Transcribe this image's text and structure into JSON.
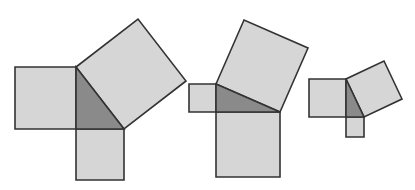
{
  "diagram": {
    "title": "",
    "colors": {
      "square_fill": "#d6d6d6",
      "triangle_fill": "#8a8a8a",
      "stroke": "#333333",
      "background": "#ffffff"
    },
    "figures": [
      {
        "id": "figure-1",
        "triangle": [
          [
            76,
            67
          ],
          [
            76,
            129
          ],
          [
            124,
            129
          ]
        ],
        "squares": [
          [
            [
              15,
              67
            ],
            [
              76,
              67
            ],
            [
              76,
              129
            ],
            [
              15,
              129
            ]
          ],
          [
            [
              76,
              129
            ],
            [
              124,
              129
            ],
            [
              124,
              180
            ],
            [
              76,
              180
            ]
          ],
          [
            [
              76,
              67
            ],
            [
              124,
              129
            ],
            [
              186,
              81
            ],
            [
              138,
              19
            ]
          ]
        ]
      },
      {
        "id": "figure-2",
        "triangle": [
          [
            216,
            84
          ],
          [
            216,
            112
          ],
          [
            280,
            112
          ]
        ],
        "squares": [
          [
            [
              189,
              84
            ],
            [
              216,
              84
            ],
            [
              216,
              112
            ],
            [
              189,
              112
            ]
          ],
          [
            [
              216,
              112
            ],
            [
              280,
              112
            ],
            [
              280,
              177
            ],
            [
              216,
              177
            ]
          ],
          [
            [
              216,
              84
            ],
            [
              280,
              112
            ],
            [
              308,
              48
            ],
            [
              244,
              20
            ]
          ]
        ]
      },
      {
        "id": "figure-3",
        "triangle": [
          [
            346,
            79
          ],
          [
            346,
            117
          ],
          [
            364,
            117
          ]
        ],
        "squares": [
          [
            [
              309,
              79
            ],
            [
              346,
              79
            ],
            [
              346,
              117
            ],
            [
              309,
              117
            ]
          ],
          [
            [
              346,
              117
            ],
            [
              364,
              117
            ],
            [
              364,
              137
            ],
            [
              346,
              137
            ]
          ],
          [
            [
              346,
              79
            ],
            [
              364,
              117
            ],
            [
              402,
              99
            ],
            [
              384,
              61
            ]
          ]
        ]
      }
    ]
  }
}
